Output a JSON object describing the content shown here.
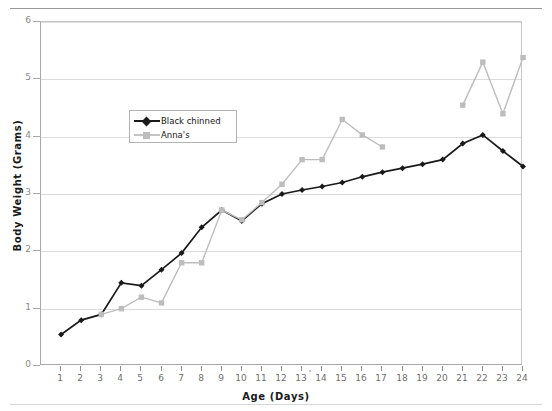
{
  "chart_data": {
    "type": "line",
    "title": "",
    "xlabel": "Age  (Days)",
    "ylabel": "Body Weight  (Grams)",
    "xlim": [
      0,
      24
    ],
    "ylim": [
      0,
      6
    ],
    "xticks": [
      1,
      2,
      3,
      4,
      5,
      6,
      7,
      8,
      9,
      10,
      11,
      12,
      13,
      14,
      15,
      16,
      17,
      18,
      19,
      20,
      21,
      22,
      23,
      24
    ],
    "yticks": [
      0,
      1,
      2,
      3,
      4,
      5,
      6
    ],
    "grid": "horizontal",
    "legend_position": "inside-upper-left",
    "x": [
      1,
      2,
      3,
      4,
      5,
      6,
      7,
      8,
      9,
      10,
      11,
      12,
      13,
      14,
      15,
      16,
      17,
      18,
      19,
      20,
      21,
      22,
      23,
      24
    ],
    "series": [
      {
        "name": "Black chinned",
        "color": "#1a1a1a",
        "marker": "diamond",
        "values": [
          0.55,
          0.8,
          0.9,
          1.45,
          1.4,
          1.68,
          1.97,
          2.42,
          2.72,
          2.53,
          2.83,
          3.0,
          3.07,
          3.13,
          3.2,
          3.3,
          3.38,
          3.45,
          3.52,
          3.6,
          3.88,
          4.03,
          3.75,
          3.48
        ]
      },
      {
        "name": "Anna's",
        "color": "#bdbdbd",
        "marker": "square",
        "values": [
          null,
          null,
          0.9,
          1.0,
          1.2,
          1.1,
          1.8,
          1.8,
          2.72,
          2.55,
          2.85,
          3.17,
          3.6,
          3.6,
          4.3,
          4.03,
          3.82,
          null,
          null,
          null,
          4.55,
          5.3,
          4.4,
          5.38
        ]
      }
    ]
  },
  "legend": {
    "entries": [
      {
        "label": "Black chinned"
      },
      {
        "label": "Anna's"
      }
    ]
  },
  "axes": {
    "y_title": "Body Weight  (Grams)",
    "x_title": "Age  (Days)",
    "y_tick_labels": [
      "0",
      "1",
      "2",
      "3",
      "4",
      "5",
      "6"
    ],
    "x_tick_labels": [
      "1",
      "2",
      "3",
      "4",
      "5",
      "6",
      "7",
      "8",
      "9",
      "10",
      "11",
      "12",
      "13",
      "14",
      "15",
      "16",
      "17",
      "18",
      "19",
      "20",
      "21",
      "22",
      "23",
      "24"
    ]
  },
  "colors": {
    "series_black": "#1a1a1a",
    "series_gray": "#bdbdbd",
    "grid": "#dcdcdc",
    "axis": "#a8a8a8",
    "tick_text": "#7a7a7a"
  }
}
